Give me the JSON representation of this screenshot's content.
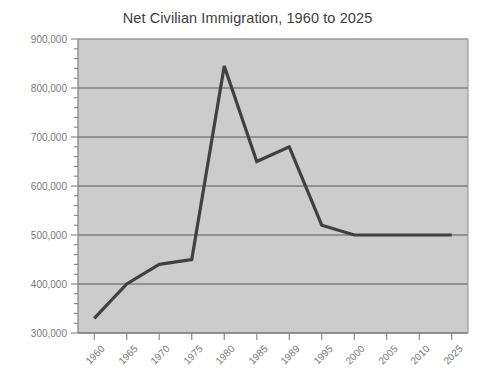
{
  "chart_data": {
    "type": "line",
    "title": "Net Civilian Immigration, 1960 to 2025",
    "xlabel": "",
    "ylabel": "",
    "categories": [
      "1960",
      "1965",
      "1970",
      "1975",
      "1980",
      "1985",
      "1989",
      "1995",
      "2000",
      "2005",
      "2010",
      "2025"
    ],
    "values": [
      330000,
      400000,
      440000,
      450000,
      845000,
      650000,
      680000,
      520000,
      500000,
      500000,
      500000,
      500000
    ],
    "ylim": [
      300000,
      900000
    ],
    "ytick_labels": [
      "900,000",
      "800,000",
      "700,000",
      "600,000",
      "500,000",
      "400,000",
      "300,000"
    ],
    "ytick_values": [
      900000,
      800000,
      700000,
      600000,
      500000,
      400000,
      300000
    ],
    "y_minor_step": 20000,
    "grid": "horizontal",
    "legend": "none",
    "colors": {
      "line": "#404040",
      "plot_background": "#cccccc",
      "page_background": "#ffffff",
      "gridline": "#595959",
      "axis": "#808080",
      "tick_label": "#7a7a7a",
      "title": "#404040"
    }
  }
}
